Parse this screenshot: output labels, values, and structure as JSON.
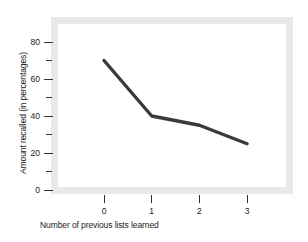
{
  "chart_data": {
    "type": "line",
    "title": "",
    "subtitle": "",
    "xlabel": "Number of previous lists learned",
    "ylabel": "Amount recalled (in percentages)",
    "x": [
      0,
      1,
      2,
      3
    ],
    "values": [
      70,
      40,
      35,
      25
    ],
    "series": [
      {
        "name": "Amount recalled",
        "values": [
          70,
          40,
          35,
          25
        ]
      }
    ],
    "xlim": [
      -0.35,
      3.4
    ],
    "ylim": [
      0,
      90
    ],
    "xticks": [
      "0",
      "1",
      "2",
      "3"
    ],
    "yticks": [
      "0",
      "20",
      "40",
      "60",
      "80"
    ],
    "yminor": [
      10,
      30,
      50,
      70
    ],
    "grid": false,
    "legend": false,
    "legend_position": "none",
    "annotations": [],
    "colors": {
      "line": "#3a3a3a",
      "frame": "#e9e9e9",
      "plot_background": "#ffffff",
      "text": "#1a1a1a",
      "tick": "#333333"
    }
  },
  "axes": {
    "y_ticks": [
      {
        "label": "80",
        "value": 80,
        "major": true
      },
      {
        "label": "",
        "value": 70,
        "major": false
      },
      {
        "label": "60",
        "value": 60,
        "major": true
      },
      {
        "label": "",
        "value": 50,
        "major": false
      },
      {
        "label": "40",
        "value": 40,
        "major": true
      },
      {
        "label": "",
        "value": 30,
        "major": false
      },
      {
        "label": "20",
        "value": 20,
        "major": true
      },
      {
        "label": "",
        "value": 10,
        "major": false
      },
      {
        "label": "0",
        "value": 0,
        "major": true
      }
    ],
    "x_ticks": [
      {
        "label": "0",
        "value": 0
      },
      {
        "label": "1",
        "value": 1
      },
      {
        "label": "2",
        "value": 2
      },
      {
        "label": "3",
        "value": 3
      }
    ]
  }
}
